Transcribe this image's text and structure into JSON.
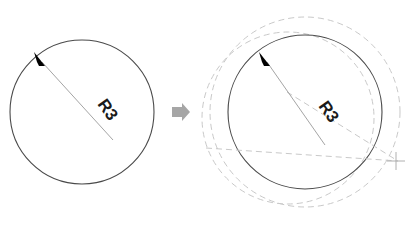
{
  "figure": {
    "background_color": "#ffffff",
    "width": 411,
    "height": 230
  },
  "colors": {
    "solid_stroke": "#4a4a4a",
    "leader_stroke": "#9a9a9a",
    "dashed_stroke": "#c9c9c9",
    "arrowhead_fill": "#000000",
    "transition_arrow": "#a6a6a6",
    "crosshair": "#b0b0b0",
    "text": "#1a1a1a"
  },
  "left_panel": {
    "name": "before-state",
    "circle": {
      "cx": 82,
      "cy": 112,
      "r": 72,
      "style": "solid"
    },
    "radius_leader": {
      "from_x": 113,
      "from_y": 140,
      "to_x": 38,
      "to_y": 58,
      "arrow_at": "to"
    },
    "label": {
      "text": "R3",
      "x": 97,
      "y": 104,
      "rotation": 55,
      "font_size": 17
    }
  },
  "transition": {
    "name": "transition-arrow",
    "glyph": "right-arrow",
    "x": 180,
    "y": 112
  },
  "right_panel": {
    "name": "after-state",
    "circle": {
      "cx": 305,
      "cy": 112,
      "r": 77,
      "style": "solid"
    },
    "construction_circles": [
      {
        "cx": 305,
        "cy": 112,
        "r": 95,
        "style": "dashed",
        "name": "outer-construction-circle"
      },
      {
        "cx": 288,
        "cy": 118,
        "r": 86,
        "style": "dashed",
        "name": "offset-construction-circle"
      }
    ],
    "construction_lines": [
      {
        "x1": 206,
        "y1": 148,
        "x2": 396,
        "y2": 161,
        "style": "dashed",
        "name": "horizontal-reference-line"
      },
      {
        "x1": 287,
        "y1": 92,
        "x2": 396,
        "y2": 161,
        "style": "dashed",
        "name": "diagonal-reference-line"
      }
    ],
    "radius_leader": {
      "from_x": 325,
      "from_y": 145,
      "to_x": 263,
      "to_y": 58,
      "arrow_at": "to"
    },
    "label": {
      "text": "R3",
      "x": 318,
      "y": 106,
      "rotation": 55,
      "font_size": 17
    },
    "crosshair": {
      "cx": 396,
      "cy": 161,
      "size": 9,
      "name": "center-point-marker"
    }
  }
}
